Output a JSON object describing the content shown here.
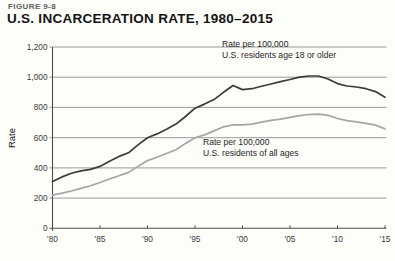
{
  "figure_label": "FIGURE 9-8",
  "title": "U.S. INCARCERATION RATE, 1980–2015",
  "chart_data": {
    "type": "line",
    "title": "U.S. INCARCERATION RATE, 1980–2015",
    "xlabel": "",
    "ylabel": "Rate",
    "ylim": [
      0,
      1200
    ],
    "grid": true,
    "legend_position": "inline-annotations",
    "x_start_year": 1980,
    "x_end_year": 2015,
    "ytick_values": [
      0,
      200,
      400,
      600,
      800,
      1000,
      1200
    ],
    "ytick_labels": [
      "0",
      "200",
      "400",
      "600",
      "800",
      "1,000",
      "1,200"
    ],
    "xtick_values": [
      1980,
      1985,
      1990,
      1995,
      2000,
      2005,
      2010,
      2015
    ],
    "xtick_labels": [
      "'80",
      "'85",
      "'90",
      "'95",
      "'00",
      "'05",
      "'10",
      "'15"
    ],
    "years": [
      1980,
      1981,
      1982,
      1983,
      1984,
      1985,
      1986,
      1987,
      1988,
      1989,
      1990,
      1991,
      1992,
      1993,
      1994,
      1995,
      1996,
      1997,
      1998,
      1999,
      2000,
      2001,
      2002,
      2003,
      2004,
      2005,
      2006,
      2007,
      2008,
      2009,
      2010,
      2011,
      2012,
      2013,
      2014,
      2015
    ],
    "series": [
      {
        "name": "adults",
        "label_line1": "Rate per 100,000",
        "label_line2": "U.S. residents age 18 or older",
        "color": "#3b3b3b",
        "values": [
          310,
          340,
          364,
          380,
          390,
          410,
          444,
          476,
          500,
          552,
          600,
          625,
          655,
          690,
          740,
          795,
          822,
          852,
          900,
          945,
          918,
          924,
          940,
          955,
          970,
          985,
          1000,
          1008,
          1008,
          988,
          958,
          942,
          935,
          924,
          905,
          868
        ]
      },
      {
        "name": "all-ages",
        "label_line1": "Rate per 100,000",
        "label_line2": "U.S. residents of all ages",
        "color": "#a5a5a5",
        "values": [
          220,
          232,
          247,
          264,
          282,
          303,
          326,
          348,
          370,
          410,
          448,
          470,
          495,
          520,
          562,
          600,
          618,
          645,
          672,
          685,
          685,
          690,
          703,
          714,
          723,
          735,
          745,
          753,
          756,
          748,
          727,
          712,
          705,
          695,
          683,
          658
        ]
      }
    ],
    "axis_color": "#4c4c4c",
    "gridline_color": "#8f8f8f"
  }
}
